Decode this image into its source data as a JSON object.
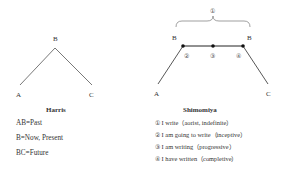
{
  "harris": {
    "title": "Harris",
    "labels": {
      "a": "A",
      "b": "B",
      "c": "C"
    },
    "legend": [
      "AB=Past",
      "B=Now, Present",
      "BC=Future"
    ]
  },
  "shimomiya": {
    "title": "Shimomiya",
    "labels": {
      "a": "A",
      "b_left": "B",
      "b_right": "B",
      "c": "C"
    },
    "bracket_marker": "①",
    "point_markers": [
      "②",
      "③",
      "④"
    ],
    "legend": [
      "① I write（aorist, indefinite）",
      "② I am going to write（inceptive）",
      "③ I am writing（progressive）",
      "④ I have written（completive）"
    ]
  }
}
